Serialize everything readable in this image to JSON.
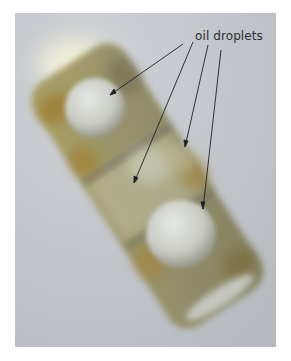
{
  "figure": {
    "annotation": {
      "label": "oil droplets",
      "arrow_count": 4
    },
    "colors": {
      "background": "#bfc3c8",
      "cell_body": "#8c8a5a",
      "cell_pigment": "#9a7a2c",
      "droplet": "#d3d6cf",
      "arrow": "#1e2024",
      "label_text": "#2a2d33"
    }
  }
}
